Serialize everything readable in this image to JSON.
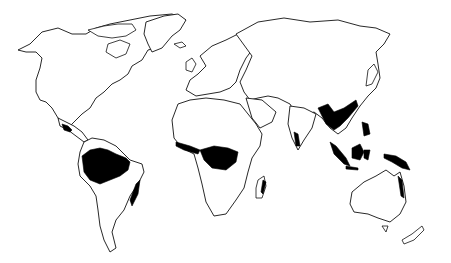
{
  "map": {
    "title": "",
    "type": "world-outline",
    "colors": {
      "background": "#ffffff",
      "outline": "#111111",
      "highlight": "#000000"
    },
    "highlighted_regions": [
      "central-america-rainforest",
      "amazon-rainforest",
      "brazil-atlantic-coast-forest",
      "west-africa-rainforest",
      "congo-rainforest",
      "madagascar-east-coast-forest",
      "india-western-ghats-forest",
      "southeast-asia-rainforest",
      "indonesia-rainforest",
      "new-guinea-rainforest",
      "northeast-australia-forest"
    ]
  }
}
